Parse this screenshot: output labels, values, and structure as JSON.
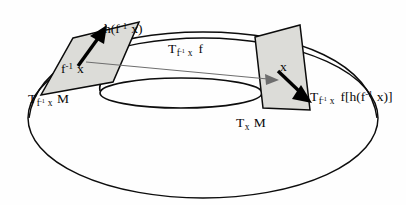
{
  "figure": {
    "type": "diagram",
    "background_color": "#fefefe",
    "line_color": "#0d0d0d",
    "plane_fill_color": "#dcdcd8",
    "map_arrow_color": "#6e6e6e",
    "vector_arrow_color": "#000000"
  },
  "manifold": {
    "name": "torus",
    "outer_ellipse": {
      "cx": 203,
      "cy": 118,
      "rx": 175,
      "ry": 80
    },
    "inner_hole_ellipse": {
      "cx": 181,
      "cy": 93,
      "rx": 81,
      "ry": 15
    }
  },
  "tangent_planes": [
    {
      "id": "plane-left",
      "label": "T_{f^-1 x} M",
      "base_point_label": "f^-1 x",
      "vector_label": "h(f^-1 x)",
      "corners": "73,38 139,22 113,82 41,95"
    },
    {
      "id": "plane-right",
      "label": "T_x M",
      "base_point_label": "x",
      "vector_label": "T_{f^-1 x} f[h(f^-1 x)]",
      "corners": "255,37 300,25 310,110 263,108"
    }
  ],
  "labels": {
    "tangent_space_source": {
      "T": "T",
      "sub_f": "f",
      "sup_inv": "-1",
      "sub_x": "x",
      "M": "M"
    },
    "base_point_source": {
      "f": "f",
      "sup_inv": "-1",
      "x": "x"
    },
    "vector_source": {
      "h_open": "h(f",
      "sup_inv": "-1",
      "x_close": "x)"
    },
    "differential_map": {
      "T": "T",
      "sub_f": "f",
      "sup_inv": "-1",
      "sub_x": "x",
      "f": "f"
    },
    "base_point_target": {
      "x": "x"
    },
    "tangent_space_target": {
      "T": "T",
      "sub_x": "x",
      "M": "M"
    },
    "pushforward_vector": {
      "T": "T",
      "sub_f": "f",
      "sup_inv": "-1",
      "sub_x": "x",
      "body_open": "f[h(f",
      "sup_inv2": "-1",
      "body_close": "x)]"
    }
  }
}
